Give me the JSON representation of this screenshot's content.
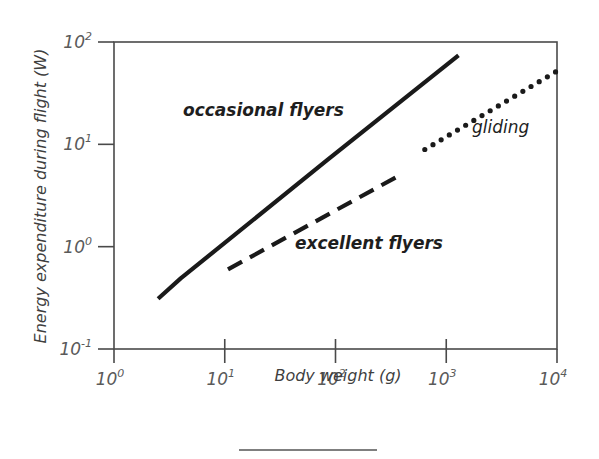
{
  "chart_data": {
    "type": "line",
    "title": "",
    "xlabel": "Body weight (g)",
    "ylabel": "Energy expenditure during flight  (W)",
    "xscale": "log",
    "yscale": "log",
    "xlim": [
      1,
      10000
    ],
    "ylim": [
      0.1,
      100
    ],
    "grid": false,
    "legend": "none (inline annotations)",
    "x_ticks": [
      {
        "value": 1,
        "base": "10",
        "exp": "0"
      },
      {
        "value": 10,
        "base": "10",
        "exp": "1"
      },
      {
        "value": 100,
        "base": "10",
        "exp": "2"
      },
      {
        "value": 1000,
        "base": "10",
        "exp": "3"
      },
      {
        "value": 10000,
        "base": "10",
        "exp": "4"
      }
    ],
    "y_ticks": [
      {
        "value": 0.1,
        "base": "10",
        "exp": "-1"
      },
      {
        "value": 1,
        "base": "10",
        "exp": "0"
      },
      {
        "value": 10,
        "base": "10",
        "exp": "1"
      },
      {
        "value": 100,
        "base": "10",
        "exp": "2"
      }
    ],
    "series": [
      {
        "name": "occasional flyers",
        "style": "solid",
        "x": [
          2.5,
          4,
          84,
          1290
        ],
        "y": [
          0.31,
          0.49,
          7.0,
          74
        ]
      },
      {
        "name": "excellent flyers",
        "style": "dashed",
        "x": [
          10.7,
          407
        ],
        "y": [
          0.6,
          5.2
        ]
      },
      {
        "name": "gliding",
        "style": "dotted",
        "x": [
          640,
          10000
        ],
        "y": [
          8.9,
          52
        ]
      }
    ],
    "annotations": [
      {
        "text": "occasional flyers",
        "x": 18,
        "y": 28
      },
      {
        "text": "excellent flyers",
        "x": 180,
        "y": 0.42
      },
      {
        "text": "gliding",
        "x": 2800,
        "y": 11
      }
    ]
  }
}
